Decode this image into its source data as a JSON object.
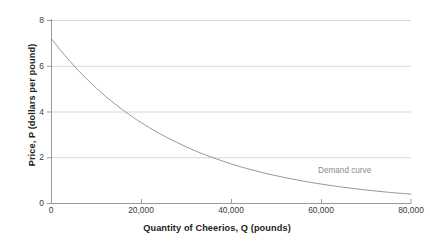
{
  "chart_data": {
    "type": "line",
    "title": "",
    "xlabel": "Quantity of Cheerios, Q (pounds)",
    "ylabel": "Price, P (dollars per pound)",
    "xlim": [
      0,
      80000
    ],
    "ylim": [
      0,
      8
    ],
    "grid": true,
    "legend": "none",
    "xticks": [
      0,
      20000,
      40000,
      60000,
      80000
    ],
    "xticklabels": [
      "0",
      "20,000",
      "40,000",
      "60,000",
      "80,000"
    ],
    "yticks": [
      0,
      2,
      4,
      6,
      8
    ],
    "yticklabels": [
      "0",
      "2",
      "4",
      "6",
      "8"
    ],
    "series": [
      {
        "name": "Demand curve",
        "color": "#8c8c8c",
        "x": [
          0,
          2000,
          4000,
          6000,
          8000,
          10000,
          12000,
          14000,
          16000,
          18000,
          20000,
          24000,
          28000,
          32000,
          36000,
          40000,
          44000,
          48000,
          52000,
          56000,
          60000,
          65000,
          70000,
          75000,
          80000
        ],
        "y": [
          7.2,
          6.7,
          6.24,
          5.81,
          5.41,
          5.04,
          4.69,
          4.37,
          4.07,
          3.79,
          3.53,
          3.06,
          2.66,
          2.3,
          2.0,
          1.73,
          1.5,
          1.3,
          1.13,
          0.98,
          0.85,
          0.71,
          0.59,
          0.49,
          0.41
        ]
      }
    ],
    "annotations": [
      {
        "text": "Demand curve",
        "x": 62000,
        "y": 1.3,
        "color": "#8c8c8c"
      }
    ]
  },
  "axes": {
    "y_title": "Price, P (dollars per pound)",
    "x_title": "Quantity of Cheerios, Q (pounds)",
    "y_labels": [
      "8",
      "6",
      "4",
      "2",
      "0"
    ],
    "x_labels": [
      "0",
      "20,000",
      "40,000",
      "60,000",
      "80,000"
    ]
  },
  "annotation": {
    "demand_curve": "Demand curve"
  },
  "colors": {
    "curve": "#8c8c8c",
    "grid": "#d6d6d6",
    "axis": "#9a9a9a",
    "text": "#231f20",
    "tick_text": "#3a3a3a",
    "background": "#ffffff"
  }
}
